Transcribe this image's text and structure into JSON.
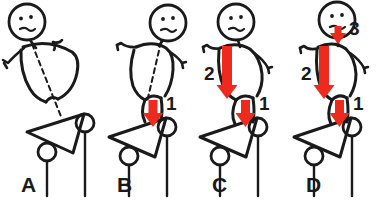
{
  "figure": {
    "caption": "",
    "stroke_color": "#1a1a1a",
    "arrow_color": "#ee2a1e",
    "background": "#ffffff",
    "panel_count": 4
  },
  "panels": [
    {
      "id": "A",
      "label": "A",
      "posture": "bent-over-horizontal",
      "face": "frown",
      "dashed_axis": true,
      "arrows": []
    },
    {
      "id": "B",
      "label": "B",
      "posture": "leaning-diagonal",
      "face": "frown",
      "dashed_axis": true,
      "arrows": [
        {
          "label": "1",
          "length": "short",
          "position": "hip"
        }
      ]
    },
    {
      "id": "C",
      "label": "C",
      "posture": "rising-upright",
      "face": "frown",
      "dashed_axis": false,
      "arrows": [
        {
          "label": "2",
          "length": "long",
          "position": "torso"
        },
        {
          "label": "1",
          "length": "short",
          "position": "hip"
        }
      ]
    },
    {
      "id": "D",
      "label": "D",
      "posture": "upright",
      "face": "frown",
      "dashed_axis": false,
      "arrows": [
        {
          "label": "3",
          "length": "tiny",
          "position": "neck"
        },
        {
          "label": "2",
          "length": "long",
          "position": "torso"
        },
        {
          "label": "1",
          "length": "short",
          "position": "hip"
        }
      ]
    }
  ],
  "platform": {
    "name": "tilted-triangle-board",
    "wheels": 2,
    "posts": 2
  }
}
